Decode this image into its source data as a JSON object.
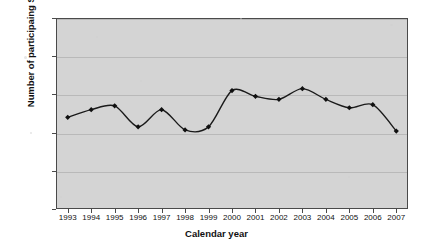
{
  "chart_data": {
    "type": "line",
    "title": "",
    "xlabel": "Calendar year",
    "ylabel": "Number of participaing States",
    "categories": [
      "1993",
      "1994",
      "1995",
      "1996",
      "1997",
      "1998",
      "1999",
      "2000",
      "2001",
      "2002",
      "2003",
      "2004",
      "2005",
      "2006",
      "2007"
    ],
    "values": [
      24,
      26,
      27,
      21.5,
      26,
      20.7,
      21.5,
      31,
      29.5,
      28.7,
      31.5,
      28.7,
      26.5,
      27.3,
      20.4
    ],
    "series": [
      {
        "name": "Number of participating States",
        "values": [
          24,
          26,
          27,
          21.5,
          26,
          20.7,
          21.5,
          31,
          29.5,
          28.7,
          31.5,
          28.7,
          26.5,
          27.3,
          20.4
        ]
      }
    ],
    "ylim": [
      0,
      50
    ],
    "yticks": [
      0,
      10,
      20,
      30,
      40,
      50
    ],
    "ytick_labels": [
      "0",
      "10",
      "20",
      "30",
      "40",
      "50"
    ],
    "grid": "horizontal",
    "legend": "none",
    "marker": "diamond",
    "line_color": "#1a1a1a",
    "marker_color": "#101010",
    "plot_background": "#d4d4d4",
    "gridline_color": "#b9b9b9",
    "axis_color": "#4a4a4a"
  }
}
